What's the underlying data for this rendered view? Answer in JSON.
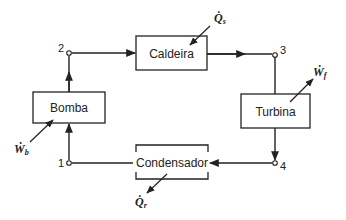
{
  "components": {
    "boiler": {
      "label": "Caldeira"
    },
    "turbine": {
      "label": "Turbina"
    },
    "condenser": {
      "label": "Condensador"
    },
    "pump": {
      "label": "Bomba"
    }
  },
  "states": [
    "1",
    "2",
    "3",
    "4"
  ],
  "energy_flows": {
    "heat_in": {
      "symbol": "Q̇",
      "subscript": "s"
    },
    "work_turbine": {
      "symbol": "Ẇ",
      "subscript": "f"
    },
    "heat_out": {
      "symbol": "Q̇",
      "subscript": "r"
    },
    "work_pump": {
      "symbol": "Ẇ",
      "subscript": "b"
    }
  }
}
